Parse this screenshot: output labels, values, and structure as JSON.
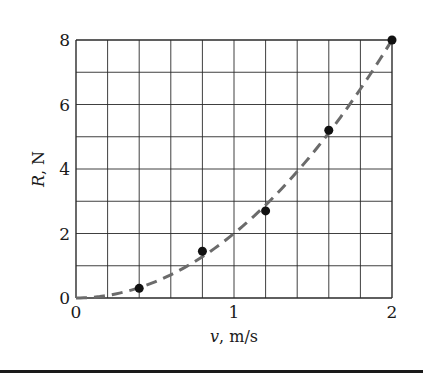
{
  "chart_data": {
    "type": "scatter",
    "title": "",
    "xlabel": "v, m/s",
    "xlabel_var": "v",
    "xlabel_unit": ", m/s",
    "ylabel": "R, N",
    "ylabel_var": "R",
    "ylabel_unit": ", N",
    "xlim": [
      0,
      2
    ],
    "ylim": [
      0,
      8
    ],
    "x_ticks": [
      0,
      1,
      2
    ],
    "y_ticks": [
      0,
      2,
      4,
      6,
      8
    ],
    "x_tick_labels": [
      "0",
      "1",
      "2"
    ],
    "y_tick_labels": [
      "0",
      "2",
      "4",
      "6",
      "8"
    ],
    "grid": {
      "on": true,
      "x_step": 0.2,
      "y_step": 1
    },
    "legend": null,
    "series": [
      {
        "name": "measured",
        "kind": "points",
        "x": [
          0.4,
          0.8,
          1.2,
          1.6,
          2.0
        ],
        "y": [
          0.3,
          1.45,
          2.7,
          5.2,
          8.0
        ]
      },
      {
        "name": "fit R = 2v^2",
        "kind": "dashed-curve",
        "formula": "R = 2v^2",
        "x": [
          0,
          0.2,
          0.4,
          0.6,
          0.8,
          1.0,
          1.2,
          1.4,
          1.6,
          1.8,
          2.0
        ],
        "y": [
          0,
          0.08,
          0.32,
          0.72,
          1.28,
          2.0,
          2.88,
          3.92,
          5.12,
          6.48,
          8.0
        ]
      }
    ]
  },
  "style": {
    "grid_color": "#2a2a2a",
    "axis_color": "#1a1a1a",
    "point_color": "#111111",
    "curve_color": "#6b6b6b",
    "background": "#ffffff"
  }
}
